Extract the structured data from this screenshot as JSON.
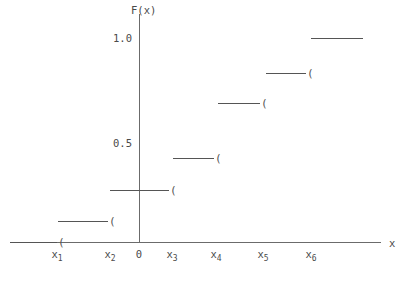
{
  "figure": {
    "type": "cdf-step-plot",
    "background_color": "#ffffff",
    "line_color": "#555555",
    "axis_color": "#6b6b6b",
    "text_color": "#4a4a4a"
  },
  "axes": {
    "y_title": "F(x)",
    "x_title": "x",
    "origin_label": "0",
    "y_ticks": [
      {
        "label": "1.0",
        "value": 1.0,
        "py": 38
      },
      {
        "label": "0.5",
        "value": 0.5,
        "py": 143
      }
    ],
    "x_ticks": [
      {
        "base": "x",
        "sub": "1",
        "py_x": 57
      },
      {
        "base": "x",
        "sub": "2",
        "py_x": 110
      },
      {
        "base": "x",
        "sub": "3",
        "py_x": 172
      },
      {
        "base": "x",
        "sub": "4",
        "py_x": 216
      },
      {
        "base": "x",
        "sub": "5",
        "py_x": 263
      },
      {
        "base": "x",
        "sub": "6",
        "py_x": 311
      }
    ],
    "y_axis_px": 139,
    "y_axis_top_px": 14,
    "x_axis_px": 242,
    "x_axis_left_px": 10,
    "x_axis_right_px": 381
  },
  "chart_data": {
    "type": "line",
    "title": "",
    "subtitle": "",
    "xlabel": "x",
    "ylabel": "F(x)",
    "grid": false,
    "legend": "none",
    "ylim": [
      0,
      1.0
    ],
    "y_tick_values": [
      0.5,
      1.0
    ],
    "y_tick_labels": [
      "0.5",
      "1.0"
    ],
    "x_tick_labels": [
      "x1",
      "x2",
      "x3",
      "x4",
      "x5",
      "x6"
    ],
    "jump_points": [
      "x1",
      "x2",
      "x3",
      "x4",
      "x5",
      "x6"
    ],
    "steps": [
      {
        "name": "below-x1",
        "from": "-inf",
        "to": "x1",
        "value": 0.0,
        "label": "0",
        "px_x1": 10,
        "px_x2": 57,
        "px_y": 242,
        "open_mark": "(",
        "has_open_mark": true
      },
      {
        "name": "x1-to-x2",
        "from": "x1",
        "to": "x2",
        "value": 0.12,
        "label": "0.12",
        "px_x1": 58,
        "px_x2": 108,
        "px_y": 221,
        "open_mark": "(",
        "has_open_mark": true
      },
      {
        "name": "x2-to-x3",
        "from": "x2",
        "to": "x3",
        "value": 0.25,
        "label": "0.25",
        "px_x1": 110,
        "px_x2": 169,
        "px_y": 190,
        "open_mark": "(",
        "has_open_mark": true
      },
      {
        "name": "x3-to-x4",
        "from": "x3",
        "to": "x4",
        "value": 0.41,
        "label": "0.41",
        "px_x1": 173,
        "px_x2": 214,
        "px_y": 158,
        "open_mark": "(",
        "has_open_mark": true
      },
      {
        "name": "x4-to-x5",
        "from": "x4",
        "to": "x5",
        "value": 0.67,
        "label": "0.67",
        "px_x1": 218,
        "px_x2": 260,
        "px_y": 103,
        "open_mark": "(",
        "has_open_mark": true
      },
      {
        "name": "x5-to-x6",
        "from": "x5",
        "to": "x6",
        "value": 0.82,
        "label": "0.82",
        "px_x1": 266,
        "px_x2": 306,
        "px_y": 73,
        "open_mark": "(",
        "has_open_mark": true
      },
      {
        "name": "above-x6",
        "from": "x6",
        "to": "+inf",
        "value": 1.0,
        "label": "1.0",
        "px_x1": 311,
        "px_x2": 363,
        "px_y": 38,
        "open_mark": "",
        "has_open_mark": false
      }
    ]
  }
}
